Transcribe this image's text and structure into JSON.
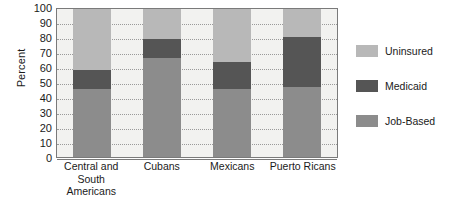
{
  "chart_data": {
    "type": "bar",
    "subtype": "stacked-bar",
    "title": "",
    "xlabel": "",
    "ylabel": "Percent",
    "ylim": [
      0,
      100
    ],
    "ytick_step": 10,
    "yticks": [
      100,
      90,
      80,
      70,
      60,
      50,
      40,
      30,
      20,
      10,
      0
    ],
    "grid": true,
    "grid_axis": "y",
    "legend_position": "right",
    "stack_order_bottom_to_top": [
      "Job-Based",
      "Medicaid",
      "Uninsured"
    ],
    "categories": [
      "Central and South Americans",
      "Cubans",
      "Mexicans",
      "Puerto Ricans"
    ],
    "category_label_lines": [
      [
        "Central and South",
        "Americans"
      ],
      [
        "Cubans"
      ],
      [
        "Mexicans"
      ],
      [
        "Puerto Ricans"
      ]
    ],
    "series": [
      {
        "name": "Job-Based",
        "color": "#8c8c8c",
        "values": [
          46,
          67,
          46,
          47
        ]
      },
      {
        "name": "Medicaid",
        "color": "#555555",
        "values": [
          13,
          13,
          18,
          34
        ]
      },
      {
        "name": "Uninsured",
        "color": "#b8b8b8",
        "values": [
          41,
          20,
          36,
          19
        ]
      }
    ],
    "cumulative_tops": {
      "Job-Based": [
        46,
        67,
        46,
        47
      ],
      "Medicaid": [
        59,
        80,
        64,
        81
      ],
      "Uninsured": [
        100,
        100,
        100,
        100
      ]
    }
  },
  "legend": {
    "items": [
      {
        "label": "Uninsured",
        "color": "#b8b8b8"
      },
      {
        "label": "Medicaid",
        "color": "#555555"
      },
      {
        "label": "Job-Based",
        "color": "#8c8c8c"
      }
    ]
  },
  "colors": {
    "plot_background": "#f2f2f0",
    "frame": "#7a7a7a",
    "gridline": "#9a9a9a",
    "text": "#1a1a1a",
    "page_background": "#ffffff"
  }
}
